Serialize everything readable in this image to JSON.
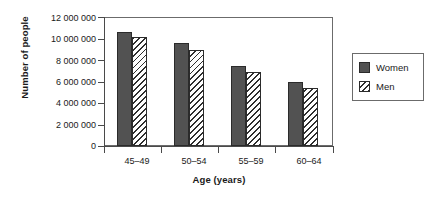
{
  "chart_data": {
    "type": "bar",
    "title": "",
    "xlabel": "Age (years)",
    "ylabel": "Number of people",
    "categories": [
      "45–49",
      "50–54",
      "55–59",
      "60–64"
    ],
    "series": [
      {
        "name": "Women",
        "values": [
          10600000,
          9550000,
          7400000,
          5950000
        ],
        "color": "#525252",
        "fill": "solid"
      },
      {
        "name": "Men",
        "values": [
          10100000,
          8950000,
          6900000,
          5350000
        ],
        "color": "#ffffff",
        "fill": "diagonal-hatch"
      }
    ],
    "ylim": [
      0,
      12000000
    ],
    "ytick_values": [
      0,
      2000000,
      4000000,
      6000000,
      8000000,
      10000000,
      12000000
    ],
    "ytick_labels": [
      "0",
      "2 000 000",
      "4 000 000",
      "6 000 000",
      "8 000 000",
      "10 000 000",
      "12 000 000"
    ],
    "grid": false,
    "legend_position": "right-outside",
    "legend_entries": [
      "Women",
      "Men"
    ]
  },
  "legend": {
    "items": [
      {
        "label": "Women",
        "swatch": "solid-dark-gray-swatch"
      },
      {
        "label": "Men",
        "swatch": "diagonal-hatch-swatch"
      }
    ]
  }
}
